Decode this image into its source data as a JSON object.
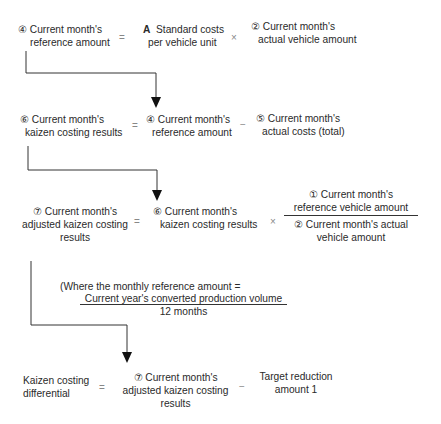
{
  "row1": {
    "lhs": [
      "④ Current month's",
      "reference amount"
    ],
    "op1": "=",
    "term1_marker": "A",
    "term1": [
      "Standard costs",
      "per vehicle unit"
    ],
    "op2": "×",
    "term2": [
      "② Current month's",
      "actual vehicle amount"
    ]
  },
  "row2": {
    "lhs": [
      "⑥ Current month's",
      "kaizen costing results"
    ],
    "op1": "=",
    "term1": [
      "④ Current month's",
      "reference amount"
    ],
    "op2": "−",
    "term2": [
      "⑤ Current month's",
      "actual costs (total)"
    ]
  },
  "row3": {
    "lhs": [
      "⑦ Current month's",
      "adjusted kaizen costing",
      "results"
    ],
    "op1": "=",
    "term1": [
      "⑥ Current month's",
      "kaizen costing results"
    ],
    "op2": "×",
    "numerator": [
      "① Current month's",
      "reference vehicle amount"
    ],
    "denominator": [
      "② Current month's actual",
      "vehicle amount"
    ]
  },
  "note": {
    "prefix": "(Where the monthly reference amount =",
    "numerator": "Current year's converted production volume",
    "denominator": "12 months"
  },
  "row4": {
    "lhs": [
      "Kaizen costing",
      "differential"
    ],
    "op1": "=",
    "term1": [
      "⑦ Current month's",
      "adjusted kaizen costing",
      "results"
    ],
    "op2": "−",
    "term2": [
      "Target reduction",
      "amount 1"
    ]
  }
}
